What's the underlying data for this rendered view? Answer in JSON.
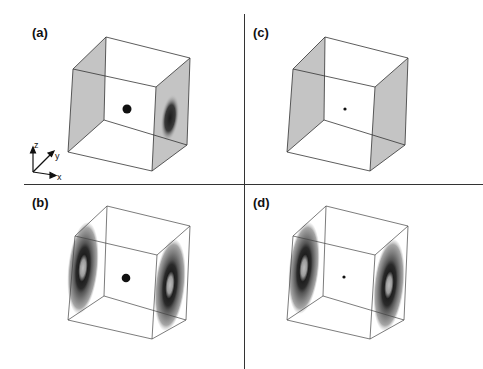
{
  "figure": {
    "panels": [
      {
        "id": "a",
        "label": "(a)",
        "central_dot": "large",
        "left_wall": "uniform-gray",
        "right_wall": "dark-blob"
      },
      {
        "id": "c",
        "label": "(c)",
        "central_dot": "small",
        "left_wall": "uniform-gray",
        "right_wall": "uniform-gray"
      },
      {
        "id": "b",
        "label": "(b)",
        "central_dot": "large",
        "left_wall": "ring-pattern",
        "right_wall": "ring-pattern"
      },
      {
        "id": "d",
        "label": "(d)",
        "central_dot": "small",
        "left_wall": "ring-pattern",
        "right_wall": "ring-pattern"
      }
    ],
    "axes": {
      "x": "x",
      "y": "y",
      "z": "z"
    },
    "colors": {
      "wall_gray": "#c4c4c4",
      "edge": "#333333",
      "dot": "#111111",
      "ring_dark": "#222222",
      "ring_mid": "#6a6a6a",
      "ring_light": "#a8a8a8"
    }
  }
}
